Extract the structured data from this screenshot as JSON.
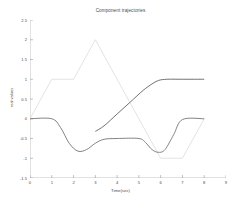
{
  "chart_data": {
    "type": "line",
    "title": "Component trajectories",
    "xlabel": "Time(sec)",
    "ylabel": "real values",
    "xlim": [
      0,
      9
    ],
    "ylim": [
      -1.5,
      2.5
    ],
    "xticks": [
      "0",
      "1",
      "2",
      "3",
      "4",
      "5",
      "6",
      "7",
      "8",
      "9"
    ],
    "yticks": [
      "2.5",
      "2",
      "1.5",
      "1",
      "0.5",
      "0",
      "-0.5",
      "-1",
      "-1.5"
    ],
    "grid": false,
    "legend": "none",
    "colors": {
      "reference": "#d9d9d9",
      "component_a": "#6b6b6b",
      "component_b": "#595959",
      "axis": "#8a8a8a"
    },
    "series": [
      {
        "name": "reference",
        "style": "piecewise-linear",
        "color": "#d9d9d9",
        "x": [
          0,
          1,
          2,
          3,
          6,
          7,
          8
        ],
        "values": [
          0,
          1,
          1,
          2,
          -1,
          -1,
          0
        ]
      },
      {
        "name": "component_a",
        "style": "smooth",
        "color": "#6b6b6b",
        "x": [
          0,
          1,
          1.4,
          1.8,
          2.2,
          2.6,
          3.0,
          3.4,
          4.0,
          5.0,
          5.3,
          5.6,
          5.9,
          6.2,
          6.6,
          7.0,
          8.0
        ],
        "values": [
          0,
          0,
          -0.22,
          -0.62,
          -0.82,
          -0.78,
          -0.62,
          -0.52,
          -0.5,
          -0.5,
          -0.6,
          -0.78,
          -0.85,
          -0.78,
          -0.4,
          -0.02,
          0
        ]
      },
      {
        "name": "component_b",
        "style": "smooth",
        "color": "#595959",
        "x": [
          3.0,
          3.4,
          4.0,
          4.6,
          5.2,
          5.6,
          5.9,
          6.3,
          7.0,
          8.0
        ],
        "values": [
          -0.32,
          -0.18,
          0.12,
          0.42,
          0.72,
          0.88,
          0.97,
          1.0,
          1.0,
          1.0
        ]
      }
    ]
  }
}
